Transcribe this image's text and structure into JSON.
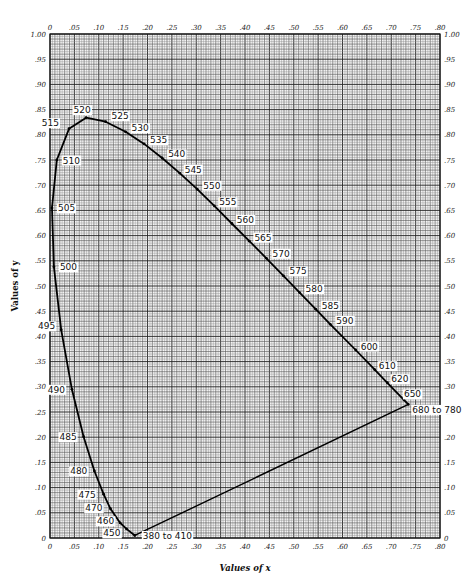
{
  "chart_data": {
    "type": "line",
    "title": "",
    "xlabel": "Values of x",
    "ylabel": "Values of y",
    "xlim": [
      0,
      0.8
    ],
    "ylim": [
      0,
      1.0
    ],
    "grid": true,
    "grid_minor_step": 0.01,
    "grid_major_step": 0.05,
    "x_ticks": [
      "0",
      ".05",
      ".10",
      ".15",
      ".20",
      ".25",
      ".30",
      ".35",
      ".40",
      ".45",
      ".50",
      ".55",
      ".60",
      ".65",
      ".70",
      ".75",
      ".80"
    ],
    "y_ticks": [
      "0",
      ".05",
      ".10",
      ".15",
      ".20",
      ".25",
      ".30",
      ".35",
      ".40",
      ".45",
      ".50",
      ".55",
      ".60",
      ".65",
      ".70",
      ".75",
      ".80",
      ".85",
      ".90",
      ".95",
      "1.00"
    ],
    "series": [
      {
        "name": "Spectrum locus",
        "points": [
          {
            "label": "380 to 410",
            "x": 0.174,
            "y": 0.005
          },
          {
            "label": "450",
            "x": 0.157,
            "y": 0.018
          },
          {
            "label": "460",
            "x": 0.144,
            "y": 0.03
          },
          {
            "label": "470",
            "x": 0.124,
            "y": 0.058
          },
          {
            "label": "475",
            "x": 0.11,
            "y": 0.087
          },
          {
            "label": "480",
            "x": 0.091,
            "y": 0.133
          },
          {
            "label": "485",
            "x": 0.069,
            "y": 0.201
          },
          {
            "label": "490",
            "x": 0.045,
            "y": 0.295
          },
          {
            "label": "495",
            "x": 0.023,
            "y": 0.413
          },
          {
            "label": "500",
            "x": 0.008,
            "y": 0.538
          },
          {
            "label": "505",
            "x": 0.004,
            "y": 0.655
          },
          {
            "label": "510",
            "x": 0.014,
            "y": 0.75
          },
          {
            "label": "515",
            "x": 0.039,
            "y": 0.812
          },
          {
            "label": "520",
            "x": 0.074,
            "y": 0.834
          },
          {
            "label": "525",
            "x": 0.114,
            "y": 0.826
          },
          {
            "label": "530",
            "x": 0.155,
            "y": 0.806
          },
          {
            "label": "535",
            "x": 0.193,
            "y": 0.782
          },
          {
            "label": "540",
            "x": 0.23,
            "y": 0.754
          },
          {
            "label": "545",
            "x": 0.266,
            "y": 0.724
          },
          {
            "label": "550",
            "x": 0.302,
            "y": 0.692
          },
          {
            "label": "555",
            "x": 0.337,
            "y": 0.659
          },
          {
            "label": "560",
            "x": 0.373,
            "y": 0.624
          },
          {
            "label": "565",
            "x": 0.409,
            "y": 0.589
          },
          {
            "label": "570",
            "x": 0.444,
            "y": 0.555
          },
          {
            "label": "575",
            "x": 0.479,
            "y": 0.52
          },
          {
            "label": "580",
            "x": 0.512,
            "y": 0.487
          },
          {
            "label": "585",
            "x": 0.545,
            "y": 0.454
          },
          {
            "label": "590",
            "x": 0.575,
            "y": 0.424
          },
          {
            "label": "600",
            "x": 0.627,
            "y": 0.373
          },
          {
            "label": "610",
            "x": 0.666,
            "y": 0.334
          },
          {
            "label": "620",
            "x": 0.692,
            "y": 0.308
          },
          {
            "label": "650",
            "x": 0.726,
            "y": 0.274
          },
          {
            "label": "680 to 780",
            "x": 0.735,
            "y": 0.265
          }
        ]
      },
      {
        "name": "Purple line",
        "points": [
          {
            "x": 0.735,
            "y": 0.265
          },
          {
            "x": 0.174,
            "y": 0.005
          }
        ]
      }
    ],
    "legend": null
  },
  "labels": {
    "x_axis_title": "Values of x",
    "y_axis_title": "Values of y"
  }
}
